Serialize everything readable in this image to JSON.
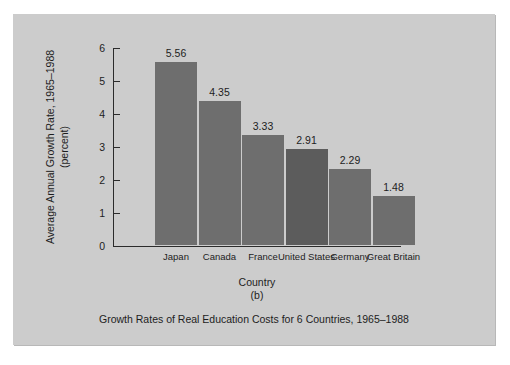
{
  "chart_data": {
    "type": "bar",
    "title": "Growth Rates of Real Education Costs for 6 Countries, 1965–1988",
    "panel_letter": "(b)",
    "xlabel": "Country",
    "ylabel": "Average Annual Growth Rate, 1965–1988 (percent)",
    "ylabel_line1": "Average Annual Growth Rate, 1965–1988",
    "ylabel_line2": "(percent)",
    "categories": [
      "Japan",
      "Canada",
      "France",
      "United States",
      "Germany",
      "Great Britain"
    ],
    "values": [
      5.56,
      4.35,
      3.33,
      2.91,
      2.29,
      1.48
    ],
    "value_labels": [
      "5.56",
      "4.35",
      "3.33",
      "2.91",
      "2.29",
      "1.48"
    ],
    "ylim": [
      0,
      6
    ],
    "yticks": [
      0,
      1,
      2,
      3,
      4,
      5,
      6
    ],
    "ytick_labels": [
      "0",
      "1",
      "2",
      "3",
      "4",
      "5",
      "6"
    ],
    "grid": false,
    "legend": false,
    "highlighted_category": "United States",
    "colors": {
      "panel_background": "#cccccc",
      "page_background": "#ffffff",
      "bar": "#6e6e6e",
      "bar_highlight": "#5c5c5c",
      "axis": "#2b2b2b",
      "text": "#1d1d1d"
    }
  }
}
